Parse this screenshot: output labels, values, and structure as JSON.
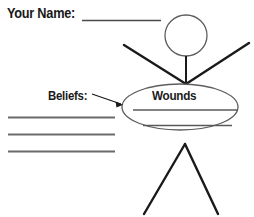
{
  "worksheet": {
    "title": "Wounds and Beliefs Stick Figure Worksheet",
    "background_color": "#ffffff",
    "ink_color": "#1a1a1a",
    "line_color": "#6b6b6b",
    "width": 254,
    "height": 217
  },
  "fields": {
    "name": {
      "label": "Your Name:",
      "value": "",
      "placeholder": ""
    },
    "beliefs": {
      "label": "Beliefs:",
      "lines": [
        "",
        "",
        ""
      ],
      "line_count": 3
    },
    "wounds": {
      "label": "Wounds",
      "lines": [
        "",
        ""
      ],
      "line_count": 2
    }
  },
  "figure": {
    "name": "stick-figure",
    "parts": [
      "head",
      "neck",
      "left-arm",
      "right-arm",
      "torso-ellipse",
      "left-leg",
      "right-leg"
    ]
  },
  "annotations": {
    "beliefs_arrow": "arrow-pointing-to-torso"
  }
}
